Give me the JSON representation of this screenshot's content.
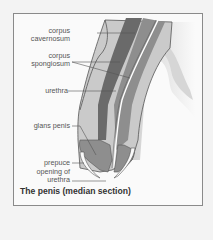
{
  "figure": {
    "title": "The penis (median section)",
    "labels": [
      {
        "id": "corpus-cavernosum",
        "line1": "corpus",
        "line2": "cavernosum"
      },
      {
        "id": "corpus-spongiosum",
        "line1": "corpus",
        "line2": "spongiosum"
      },
      {
        "id": "urethra",
        "line1": "urethra"
      },
      {
        "id": "glans-penis",
        "line1": "glans penis"
      },
      {
        "id": "prepuce",
        "line1": "prepuce"
      },
      {
        "id": "opening-of-urethra",
        "line1": "opening of",
        "line2": "urethra"
      }
    ],
    "colors": {
      "skin": "#c9c9c9",
      "cavernosum": "#6a6a6a",
      "spongiosum": "#8e8e8e",
      "urethra_line": "#ffffff",
      "outline": "#555555",
      "frame": "#8a8a8a"
    }
  }
}
